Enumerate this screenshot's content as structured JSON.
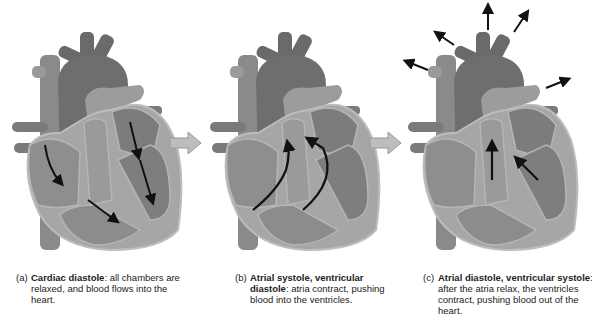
{
  "figure": {
    "panels": [
      {
        "id": "a",
        "label": "(a)",
        "title": "Cardiac diastole",
        "description": ": all chambers are relaxed, and blood flows into the heart.",
        "arrows": "blood flowing into atria and ventricles"
      },
      {
        "id": "b",
        "label": "(b)",
        "title": "Atrial systole, ventricular diastole",
        "description": ": atria contract, pushing blood into the ventricles.",
        "arrows": "blood pushed from atria into ventricles"
      },
      {
        "id": "c",
        "label": "(c)",
        "title": "Atrial diastole, ventricular systole",
        "description": ": after the atria relax, the ventricles contract, pushing blood out of the heart.",
        "arrows": "blood pushed out of the heart through arteries"
      }
    ],
    "colors": {
      "vessel": "#7a7a7a",
      "aorta": "#6a6a6a",
      "chamber": "#8c8c8c",
      "wall": "#a8a8a8",
      "outline": "#b9b9b9",
      "step_arrow": "#bdbdbd",
      "flow_arrow": "#111111"
    }
  }
}
